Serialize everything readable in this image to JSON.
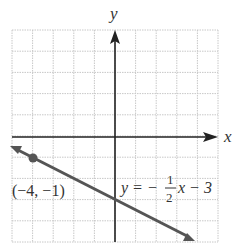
{
  "chart_data": {
    "type": "line",
    "title": "",
    "xlabel": "x",
    "ylabel": "y",
    "xlim": [
      -5,
      5
    ],
    "ylim": [
      -5,
      5
    ],
    "grid": true,
    "series": [
      {
        "name": "y = -1/2 x - 3",
        "slope": -0.5,
        "intercept": -3,
        "x": [
          -5,
          4
        ],
        "y": [
          -0.5,
          -5
        ],
        "color": "#555555"
      }
    ],
    "points": [
      {
        "x": -4,
        "y": -1,
        "label": "(-4, -1)"
      }
    ],
    "annotations": [
      {
        "text": "y = -1/2 x - 3",
        "equation_lhs": "y = -",
        "numerator": "1",
        "denominator": "2",
        "rhs": "x - 3"
      }
    ]
  },
  "labels": {
    "x_axis": "x",
    "y_axis": "y",
    "point": "(−4, −1)",
    "eq_lhs": "y = −",
    "eq_num": "1",
    "eq_den": "2",
    "eq_rhs": "x − 3"
  },
  "colors": {
    "grid": "#c8c8c8",
    "axis": "#222222",
    "line": "#555555"
  }
}
